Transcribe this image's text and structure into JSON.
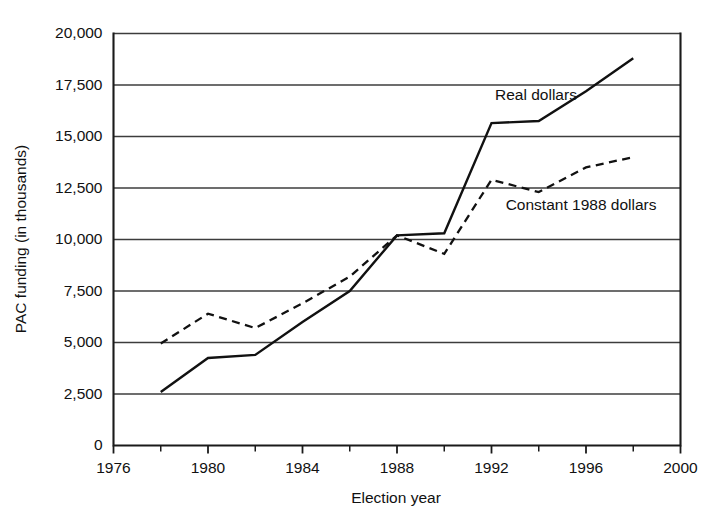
{
  "chart_data": {
    "type": "line",
    "title": "",
    "xlabel": "Election year",
    "ylabel": "PAC funding (in thousands)",
    "xlim": [
      1976,
      2000
    ],
    "ylim": [
      0,
      20000
    ],
    "grid": true,
    "grid_axis": "y",
    "legend_position": "inline-annotation",
    "x_major_ticks": [
      1976,
      1980,
      1984,
      1988,
      1992,
      1996,
      2000
    ],
    "x_minor_ticks": [
      1978,
      1982,
      1986,
      1990,
      1994,
      1998
    ],
    "x_tick_labels": [
      "1976",
      "1980",
      "1984",
      "1988",
      "1992",
      "1996",
      "2000"
    ],
    "y_ticks": [
      0,
      2500,
      5000,
      7500,
      10000,
      12500,
      15000,
      17500,
      20000
    ],
    "y_tick_labels": [
      "0",
      "2,500",
      "5,000",
      "7,500",
      "10,000",
      "12,500",
      "15,000",
      "17,500",
      "20,000"
    ],
    "series": [
      {
        "name": "Real dollars",
        "style": "solid",
        "color": "#111111",
        "label_x": 1992.15,
        "label_y": 16750,
        "x": [
          1978,
          1980,
          1982,
          1984,
          1986,
          1988,
          1990,
          1992,
          1994,
          1996,
          1998
        ],
        "values": [
          2600,
          4250,
          4400,
          6000,
          7500,
          10200,
          10300,
          15650,
          15750,
          17200,
          18800
        ]
      },
      {
        "name": "Constant 1988 dollars",
        "style": "dashed",
        "color": "#111111",
        "label_x": 1992.6,
        "label_y": 11450,
        "x": [
          1978,
          1980,
          1982,
          1984,
          1986,
          1988,
          1990,
          1992,
          1994,
          1996,
          1998
        ],
        "values": [
          4950,
          6400,
          5700,
          6900,
          8200,
          10200,
          9300,
          12900,
          12300,
          13500,
          14000
        ]
      }
    ]
  },
  "axes": {
    "y_title": "PAC funding (in thousands)",
    "x_title": "Election year"
  }
}
